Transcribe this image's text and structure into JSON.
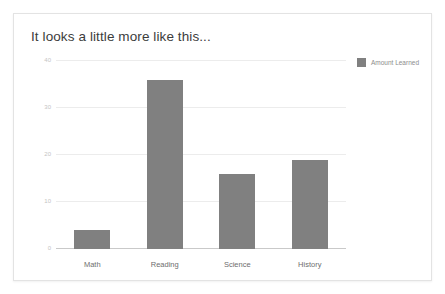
{
  "card": {
    "title": "It looks a little more like this..."
  },
  "chart_data": {
    "type": "bar",
    "title": "It looks a little more like this...",
    "categories": [
      "Math",
      "Reading",
      "Science",
      "History"
    ],
    "values": [
      4,
      36,
      16,
      19
    ],
    "series": [
      {
        "name": "Amount Learned",
        "values": [
          4,
          36,
          16,
          19
        ]
      }
    ],
    "legend": [
      "Amount Learned"
    ],
    "legend_position": "top-right",
    "xlabel": "",
    "ylabel": "",
    "ylim": [
      0,
      40
    ],
    "yticks": [
      0,
      10,
      20,
      30,
      40
    ],
    "ytick_labels": [
      "0",
      "10",
      "20",
      "30",
      "40"
    ],
    "grid": true,
    "bar_color": "#808080",
    "gridline_color": "#ececec",
    "axis_color": "#c9c9c9"
  }
}
